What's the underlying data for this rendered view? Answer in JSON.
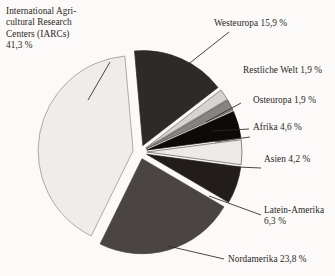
{
  "chart_data": {
    "type": "pie",
    "title": "",
    "subtitle": "",
    "xlabel": "",
    "ylabel": "",
    "legend_position": "none",
    "grid": false,
    "unit": "%",
    "decimal_separator": ",",
    "total": 100.0,
    "categories": [
      "Westeuropa",
      "Restliche Welt",
      "Osteuropa",
      "Afrika",
      "Asien",
      "Latein-Amerika",
      "Nordamerika",
      "International Agricultural Research Centers (IARCs)"
    ],
    "values": [
      15.9,
      1.9,
      1.9,
      4.6,
      4.2,
      6.3,
      23.8,
      41.3
    ],
    "slices": [
      {
        "key": "westeuropa",
        "name": "Westeuropa",
        "value": 15.9,
        "label": "Westeuropa 15,9 %",
        "color": "#2e2a28",
        "stroke": "#2e2a28"
      },
      {
        "key": "restliche-welt",
        "name": "Restliche Welt",
        "value": 1.9,
        "label": "Restliche Welt 1,9 %",
        "color": "#d6d4d0",
        "stroke": "#6b6864"
      },
      {
        "key": "osteuropa",
        "name": "Osteuropa",
        "value": 1.9,
        "label": "Osteuropa 1,9 %",
        "color": "#868380",
        "stroke": "#4a4644"
      },
      {
        "key": "afrika",
        "name": "Afrika",
        "value": 4.6,
        "label": "Afrika 4,6 %",
        "color": "#0c0b0a",
        "stroke": "#0c0b0a"
      },
      {
        "key": "asien",
        "name": "Asien",
        "value": 4.2,
        "label": "Asien 4,2 %",
        "color": "#eceae6",
        "stroke": "#5d5a57"
      },
      {
        "key": "latein-amerika",
        "name": "Latein-Amerika",
        "value": 6.3,
        "label": "Latein-Amerika\n6,3 %",
        "color": "#221c1a",
        "stroke": "#221c1a"
      },
      {
        "key": "nordamerika",
        "name": "Nordamerika",
        "value": 23.8,
        "label": "Nordamerika 23,8 %",
        "color": "#4a4544",
        "stroke": "#4a4544"
      },
      {
        "key": "iarcs",
        "name": "International Agricultural Research Centers (IARCs)",
        "value": 41.3,
        "label": "International Agri-\ncultural Research\nCenters (IARCs)\n41,3 %",
        "color": "#eeedeb",
        "stroke": "#8e8b87"
      }
    ]
  },
  "labels": {
    "iarcs": "International Agri-\ncultural Research\nCenters (IARCs)\n41,3 %",
    "westeuropa": "Westeuropa 15,9 %",
    "restliche_welt": "Restliche Welt 1,9 %",
    "osteuropa": "Osteuropa 1,9 %",
    "afrika": "Afrika 4,6 %",
    "asien": "Asien 4,2 %",
    "latein_amerika": "Latein-Amerika\n6,3 %",
    "nordamerika": "Nordamerika 23,8 %"
  },
  "colors": {
    "background": "#fbfaf8",
    "text": "#2b2724",
    "leader_line": "#2b2724"
  }
}
